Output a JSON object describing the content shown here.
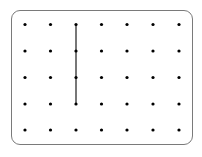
{
  "diagram": {
    "type": "geoboard-dot-grid",
    "columns": 7,
    "rows": 5,
    "col_x": [
      25,
      50.5,
      76,
      101.5,
      127,
      153,
      179
    ],
    "row_y": [
      24.5,
      51,
      77.5,
      104,
      130
    ],
    "dot_color": "#000000",
    "dot_radius": 1.6,
    "border_color": "#7a7a7a",
    "segments": [
      {
        "from": {
          "col": 3,
          "row": 1
        },
        "to": {
          "col": 3,
          "row": 4
        },
        "color": "#555555",
        "width": 1.6
      }
    ]
  }
}
